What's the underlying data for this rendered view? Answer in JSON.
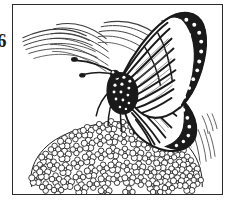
{
  "document": {
    "page_number": "6",
    "kind": "line-art-illustration",
    "palette": {
      "ink": "#1a1a1a",
      "frame": "#2b2b2b",
      "paper": "#ffffff",
      "hatching": "#4a4a4a"
    }
  },
  "illustration": {
    "title": "Monarch butterfly on flower cluster",
    "subject_label": "monarch-butterfly",
    "perch_label": "flower-cluster",
    "background_label": "background-hatching",
    "style": "black-and-white coloring book line art",
    "elements": [
      {
        "name": "butterfly-forewing",
        "label": "forewing with white-spotted black margin"
      },
      {
        "name": "butterfly-hindwing",
        "label": "hindwing with radiating black veins"
      },
      {
        "name": "butterfly-body",
        "label": "spotted black thorax and abdomen"
      },
      {
        "name": "butterfly-antennae",
        "label": "pair of clubbed antennae"
      },
      {
        "name": "butterfly-legs",
        "label": "legs gripping blossoms"
      },
      {
        "name": "flower-cluster",
        "label": "dome of small five-petal blossoms"
      },
      {
        "name": "hatching-upper-left",
        "label": "curved shading strokes, upper left"
      },
      {
        "name": "hatching-lower-right",
        "label": "straight shading strokes, lower right"
      }
    ]
  }
}
